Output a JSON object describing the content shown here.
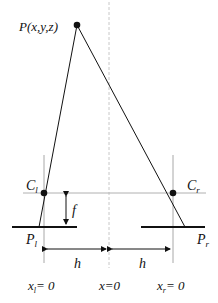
{
  "diagram": {
    "point": {
      "label": "P(x,y,z)"
    },
    "cameras": {
      "left": {
        "center_label": "C",
        "center_sub": "l",
        "plane_label": "P",
        "plane_sub": "l",
        "origin_label": "x",
        "origin_sub": "l",
        "origin_value": "= 0"
      },
      "right": {
        "center_label": "C",
        "center_sub": "r",
        "plane_label": "P",
        "plane_sub": "r",
        "origin_label": "x",
        "origin_sub": "r",
        "origin_value": "= 0"
      }
    },
    "focal_label": "f",
    "baseline_half_label_left": "h",
    "baseline_half_label_right": "h",
    "center_origin_label": "x=0",
    "colors": {
      "line": "#111111",
      "guide": "#b0b0b0",
      "dashed": "#c8c8c8"
    }
  }
}
